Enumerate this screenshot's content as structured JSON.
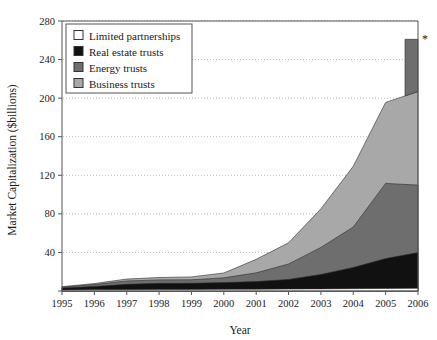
{
  "chart_data": {
    "type": "area",
    "stacked": true,
    "title": "",
    "xlabel": "Year",
    "ylabel": "Market Capitalization ($billions)",
    "categories": [
      1995,
      1996,
      1997,
      1998,
      1999,
      2000,
      2001,
      2002,
      2003,
      2004,
      2005,
      2006
    ],
    "tick_labels_x": [
      "1995",
      "1996",
      "1997",
      "1998",
      "1999",
      "2000",
      "2001",
      "2002",
      "2003",
      "2004",
      "2005",
      "2006"
    ],
    "tick_labels_y": [
      "0",
      "40",
      "80",
      "120",
      "160",
      "200",
      "240",
      "280"
    ],
    "ylim": [
      0,
      280
    ],
    "ytick_step": 40,
    "xlim": [
      1995,
      2006
    ],
    "grid": "horizontal-dotted",
    "legend_position": "top-left-inside",
    "series": [
      {
        "name": "Limited partnerships",
        "color": "#ffffff",
        "values": [
          1.0,
          1.2,
          1.4,
          1.5,
          1.6,
          1.7,
          1.8,
          2.0,
          2.2,
          2.4,
          2.6,
          2.8
        ]
      },
      {
        "name": "Real estate trusts",
        "color": "#111111",
        "values": [
          2.0,
          3.5,
          5.5,
          6.5,
          6.5,
          7.0,
          8.0,
          10.0,
          15.0,
          22.0,
          31.0,
          37.0
        ]
      },
      {
        "name": "Energy trusts",
        "color": "#6e6e6e",
        "values": [
          1.0,
          2.0,
          3.5,
          3.5,
          3.5,
          5.0,
          9.0,
          16.0,
          28.0,
          42.0,
          78.0,
          70.0
        ]
      },
      {
        "name": "Business trusts",
        "color": "#a8a8a8",
        "values": [
          0.5,
          1.0,
          2.0,
          2.5,
          3.0,
          5.0,
          14.0,
          22.0,
          40.0,
          63.0,
          84.0,
          97.0
        ]
      }
    ],
    "annotations": [
      {
        "text": "*",
        "x": 2006,
        "y": 262,
        "note_for": "spike-peak-marker"
      }
    ],
    "spike": {
      "at_year": 2006,
      "peak_value": 261,
      "series": "Business trusts",
      "description": "narrow vertical spike at 2006 reaching 261"
    }
  },
  "legend": {
    "items": [
      {
        "label": "Limited partnerships",
        "swatch": "#ffffff"
      },
      {
        "label": "Real estate trusts",
        "swatch": "#111111"
      },
      {
        "label": "Energy trusts",
        "swatch": "#6e6e6e"
      },
      {
        "label": "Business trusts",
        "swatch": "#a8a8a8"
      }
    ]
  },
  "axes": {
    "x_title": "Year",
    "y_title": "Market Capitalization ($billions)"
  }
}
